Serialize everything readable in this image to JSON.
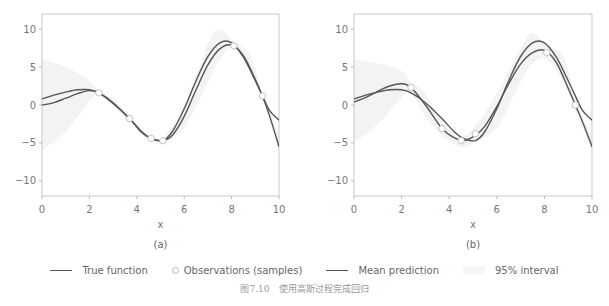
{
  "chart_data": [
    {
      "type": "line",
      "panel_label": "(a)",
      "xlabel": "x",
      "ylabel": "",
      "xlim": [
        0,
        10
      ],
      "ylim": [
        -12,
        12
      ],
      "xticks": [
        0,
        2,
        4,
        6,
        8,
        10
      ],
      "yticks": [
        -10,
        -5,
        0,
        5,
        10
      ],
      "grid": false,
      "series": [
        {
          "name": "True function",
          "x": [
            0,
            0.5,
            1,
            1.5,
            2,
            2.4,
            3,
            3.7,
            4.2,
            4.6,
            5.1,
            5.5,
            6,
            6.5,
            7,
            7.5,
            8,
            8.5,
            9,
            9.3,
            9.6,
            10
          ],
          "y": [
            0.8,
            1.3,
            1.7,
            2.0,
            2.0,
            1.6,
            0.3,
            -1.8,
            -3.5,
            -4.4,
            -4.7,
            -3.5,
            -0.5,
            3.2,
            6.4,
            8.2,
            8.2,
            6.3,
            3.2,
            1.2,
            -0.7,
            -2.0
          ]
        },
        {
          "name": "Mean prediction",
          "x": [
            0,
            0.5,
            1,
            1.5,
            2,
            2.4,
            3,
            3.7,
            4.2,
            4.6,
            5.1,
            5.5,
            6,
            6.5,
            7,
            7.5,
            8,
            8.5,
            9,
            9.3,
            9.6,
            10
          ],
          "y": [
            0.0,
            0.3,
            0.9,
            1.5,
            1.9,
            1.6,
            0.2,
            -1.8,
            -3.6,
            -4.4,
            -4.7,
            -4.0,
            -1.5,
            2.0,
            5.3,
            7.4,
            7.9,
            6.5,
            3.4,
            1.2,
            -1.4,
            -5.5
          ]
        },
        {
          "name": "Observations (samples)",
          "x": [
            2.4,
            3.7,
            4.6,
            5.1,
            8.1,
            9.3
          ],
          "y": [
            1.6,
            -1.8,
            -4.4,
            -4.7,
            7.8,
            1.2
          ]
        }
      ],
      "interval_95": {
        "x": [
          0,
          1,
          2,
          2.4,
          3,
          3.7,
          4.2,
          4.6,
          5.1,
          6,
          7,
          7.5,
          8.1,
          8.8,
          9.3,
          10
        ],
        "lower": [
          -6,
          -3.5,
          0.5,
          1.5,
          -0.2,
          -2.2,
          -3.9,
          -4.6,
          -5.0,
          -3.0,
          3.0,
          6.0,
          7.5,
          4.5,
          1.0,
          -6
        ],
        "upper": [
          6,
          5,
          3.2,
          1.8,
          0.8,
          -1.4,
          -3.2,
          -4.2,
          -4.4,
          0,
          8,
          10,
          8.3,
          6.5,
          1.5,
          -4
        ]
      }
    },
    {
      "type": "line",
      "panel_label": "(b)",
      "xlabel": "x",
      "ylabel": "",
      "xlim": [
        0,
        10
      ],
      "ylim": [
        -12,
        12
      ],
      "xticks": [
        0,
        2,
        4,
        6,
        8,
        10
      ],
      "yticks": [
        -10,
        -5,
        0,
        5,
        10
      ],
      "grid": false,
      "series": [
        {
          "name": "True function",
          "x": [
            0,
            0.5,
            1,
            1.5,
            2,
            2.4,
            3,
            3.7,
            4.2,
            4.6,
            5.1,
            5.5,
            6,
            6.5,
            7,
            7.5,
            8,
            8.5,
            9,
            9.3,
            9.6,
            10
          ],
          "y": [
            0.8,
            1.3,
            1.7,
            2.0,
            2.0,
            1.6,
            0.3,
            -1.8,
            -3.5,
            -4.4,
            -4.7,
            -3.5,
            -0.5,
            3.2,
            6.4,
            8.2,
            8.2,
            6.3,
            3.2,
            1.2,
            -0.7,
            -2.0
          ]
        },
        {
          "name": "Mean prediction",
          "x": [
            0,
            0.5,
            1,
            1.5,
            2,
            2.4,
            3,
            3.7,
            4.2,
            4.6,
            5.1,
            5.5,
            6,
            6.5,
            7,
            7.5,
            8,
            8.5,
            9,
            9.3,
            9.6,
            10
          ],
          "y": [
            0.4,
            1.0,
            1.8,
            2.5,
            2.8,
            2.3,
            0.0,
            -3.1,
            -4.3,
            -4.7,
            -4.0,
            -2.8,
            -0.2,
            2.8,
            5.4,
            6.9,
            7.2,
            5.6,
            2.2,
            0.0,
            -2.2,
            -5.5
          ]
        },
        {
          "name": "Observations (samples)",
          "x": [
            2.4,
            3.7,
            4.5,
            5.1,
            8.1,
            9.3
          ],
          "y": [
            2.3,
            -3.1,
            -4.7,
            -3.8,
            6.9,
            0.0
          ]
        }
      ],
      "interval_95": {
        "x": [
          0,
          1,
          2,
          2.4,
          3,
          3.7,
          4.5,
          5.1,
          6,
          7,
          7.5,
          8.1,
          8.8,
          9.3,
          10
        ],
        "lower": [
          -5,
          -2.5,
          1.0,
          1.5,
          -1.5,
          -4.0,
          -5.5,
          -4.8,
          -3.0,
          3.0,
          5.5,
          6.0,
          3.0,
          -0.8,
          -6
        ],
        "upper": [
          6,
          5.5,
          4.5,
          3.0,
          1.5,
          -2.2,
          -4.0,
          -2.8,
          1.5,
          7.5,
          9.5,
          7.8,
          6.5,
          0.8,
          -4
        ]
      }
    }
  ],
  "legend": {
    "items": [
      {
        "label": "True function",
        "kind": "line"
      },
      {
        "label": "Observations (samples)",
        "kind": "marker"
      },
      {
        "label": "Mean prediction",
        "kind": "line"
      },
      {
        "label": "95% interval",
        "kind": "band"
      }
    ]
  },
  "caption": "图7.10　使用高斯过程完成回归",
  "colors": {
    "true_function": "#555555",
    "mean_prediction": "#555555",
    "observation_fill": "#ffffff",
    "observation_edge": "#bbbbbb",
    "interval": "#f3f3f3",
    "axis": "#999999",
    "text": "#777777"
  }
}
